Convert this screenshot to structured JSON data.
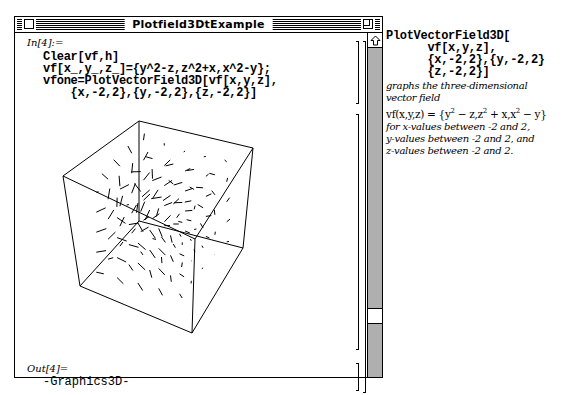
{
  "window": {
    "title": "Plotfield3DtExample",
    "close_box": "close-box",
    "zoom_box": "zoom-box"
  },
  "notebook": {
    "input_label": "In[4]:=",
    "input_lines": [
      "Clear[vf,h]",
      "vf[x_,y_,z_]={y^2-z,z^2+x,x^2-y};",
      "vfone=PlotVectorField3D[vf[x,y,z],",
      "    {x,-2,2},{y,-2,2},{z,-2,2}]"
    ],
    "output_label": "Out[4]=",
    "output_value": "-Graphics3D-"
  },
  "plot": {
    "type": "3D vector field",
    "function": "vf(x,y,z) = {y^2 - z, z^2 + x, x^2 - y}",
    "ranges": {
      "x": [
        -2,
        2
      ],
      "y": [
        -2,
        2
      ],
      "z": [
        -2,
        2
      ]
    },
    "box": "wireframe cube, no axes labels"
  },
  "scrollbar": {
    "up_arrow": "scroll-up-arrow",
    "thumb_position": "lower"
  },
  "side_panel": {
    "code_lines": [
      "PlotVectorField3D[",
      "      vf[x,y,z],",
      "      {x,-2,2},{y,-2,2}",
      "      {z,-2,2}]"
    ],
    "desc1": "graphs the three-dimensional",
    "desc2": "vector field",
    "formula_prefix": "vf(x,y,z) = ",
    "formula_parts": [
      "y",
      "2",
      " − z,z",
      "2",
      " + x,x",
      "2",
      " − y"
    ],
    "desc3": "for x-values between -2 and 2,",
    "desc4": "y-values between -2 and 2, and",
    "desc5": "z-values between -2 and 2."
  }
}
